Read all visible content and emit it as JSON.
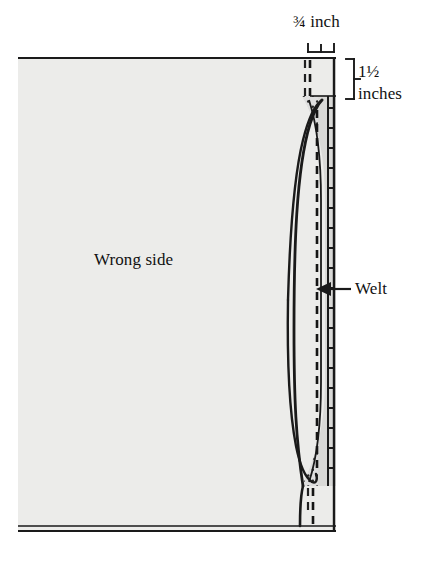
{
  "diagram": {
    "type": "sewing-illustration",
    "labels": {
      "top_measure": "¾ inch",
      "side_measure_line1": "1½",
      "side_measure_line2": "inches",
      "fabric_face": "Wrong side",
      "welt": "Welt"
    },
    "colors": {
      "background": "#ffffff",
      "fabric_fill": "#ececea",
      "welt_fill": "#d9d9d7",
      "ink": "#111111",
      "line": "#1a1a1a"
    },
    "annotations": [
      {
        "name": "top-bracket",
        "measure": "¾ inch",
        "orientation": "horizontal"
      },
      {
        "name": "side-bracket",
        "measure": "1½ inches",
        "orientation": "vertical"
      },
      {
        "name": "welt-arrow",
        "measure": "Welt",
        "orientation": "left-arrow"
      }
    ],
    "features": [
      "fabric-panel",
      "welt-strip",
      "stipple-texture",
      "dashed-stitch-line",
      "stitching-ticks",
      "upper-curve",
      "lower-curve",
      "top-dashed-marker",
      "bottom-dashed-marker",
      "bottom-fold-double-line"
    ]
  }
}
